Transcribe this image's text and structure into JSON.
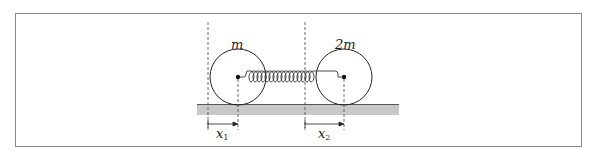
{
  "figure": {
    "masses": [
      {
        "label": "m",
        "position": "left"
      },
      {
        "label": "2m",
        "position": "right"
      }
    ],
    "displacements": [
      {
        "symbol": "x",
        "subscript": "1",
        "label": "x1"
      },
      {
        "symbol": "x",
        "subscript": "2",
        "label": "x2"
      }
    ],
    "elements": [
      "spring",
      "ground",
      "reference-lines"
    ]
  },
  "colors": {
    "stroke": "#222222",
    "ground": "#c8c8c8",
    "frame": "#8a8a8a",
    "dashed": "#444444"
  }
}
